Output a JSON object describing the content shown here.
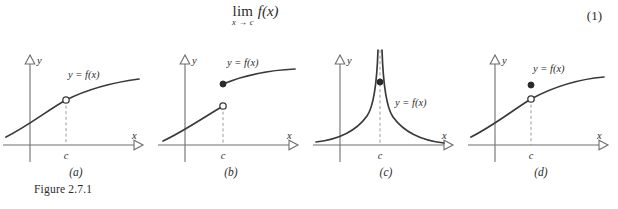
{
  "equation": {
    "limit_operator": "lim",
    "limit_subscript": "x → c",
    "function_expression": "f(x)",
    "number": "(1)"
  },
  "figure": {
    "caption": "Figure 2.7.1",
    "axis_labels": {
      "x": "x",
      "y": "y"
    },
    "tick_label": "c",
    "curve_label": "y = f(x)",
    "panels": [
      {
        "id": "a",
        "label": "(a)",
        "description": "increasing concave-down curve with an open circle (hole) at x = c; limit exists, f(c) undefined",
        "marker_open": true,
        "marker_filled": false,
        "dashed_guide": true
      },
      {
        "id": "b",
        "label": "(b)",
        "description": "jump discontinuity at x = c; lower branch ends with an open circle, upper branch begins with a filled dot",
        "marker_open": true,
        "marker_filled": true,
        "dashed_guide": true
      },
      {
        "id": "c",
        "label": "(c)",
        "description": "vertical asymptote at x = c; both branches increase without bound, filled dot marks f(c)",
        "marker_open": false,
        "marker_filled": true,
        "dashed_guide": true
      },
      {
        "id": "d",
        "label": "(d)",
        "description": "removable discontinuity at x = c; open circle on the curve with a filled dot above it",
        "marker_open": true,
        "marker_filled": true,
        "dashed_guide": true
      }
    ]
  },
  "colors": {
    "ink": "#2b2b2b",
    "curve": "#3a3a3a",
    "axis": "#6e6e6e",
    "dashed": "#9a9a9a",
    "marker_fill": "#ffffff",
    "page": "#ffffff"
  }
}
